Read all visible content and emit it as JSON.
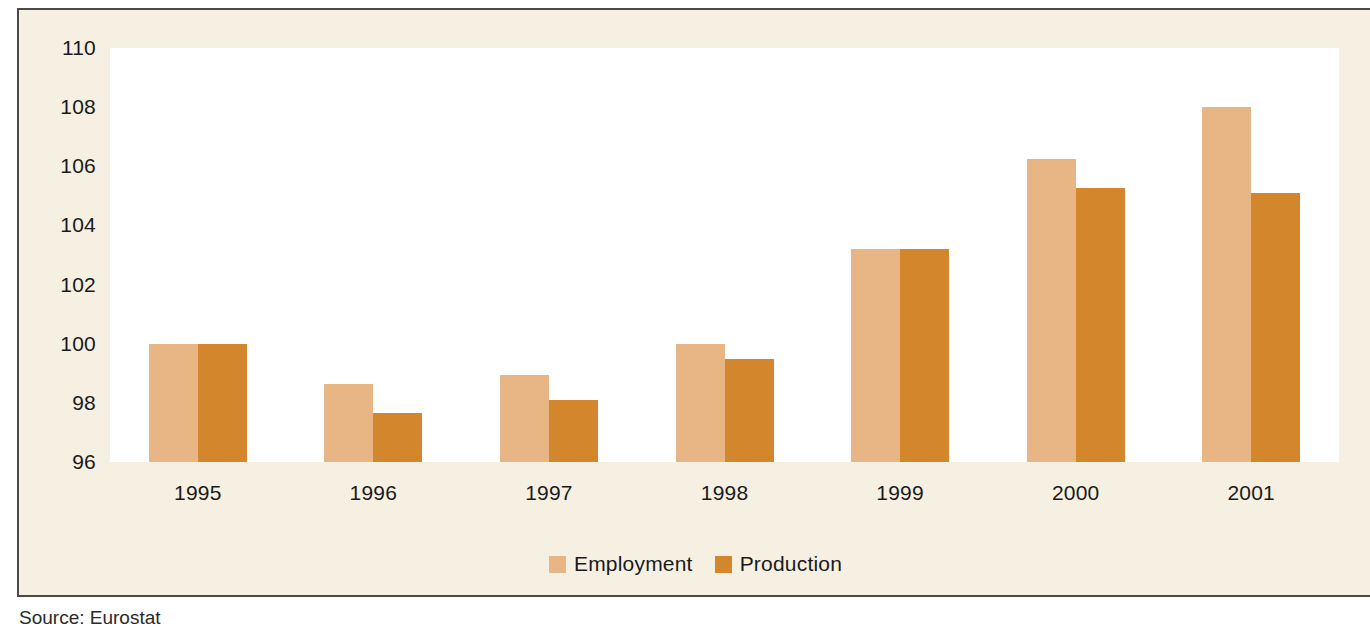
{
  "chart_data": {
    "type": "bar",
    "title": "",
    "subtitle": "",
    "xlabel": "",
    "ylabel": "",
    "categories": [
      "1995",
      "1996",
      "1997",
      "1998",
      "1999",
      "2000",
      "2001"
    ],
    "series": [
      {
        "name": "Employment",
        "color": "#E8B584",
        "values": [
          100.0,
          98.65,
          98.95,
          100.0,
          103.2,
          106.25,
          108.0
        ]
      },
      {
        "name": "Production",
        "color": "#D4862C",
        "values": [
          100.0,
          97.65,
          98.1,
          99.5,
          103.2,
          105.25,
          105.1
        ]
      }
    ],
    "ylim": [
      96,
      110
    ],
    "yticks": [
      110,
      108,
      106,
      104,
      102,
      100,
      98,
      96
    ],
    "ytick_labels": [
      "110",
      "108",
      "106",
      "104",
      "102",
      "100",
      "98",
      "96"
    ],
    "grid": false,
    "legend_position": "bottom-center"
  },
  "legend": {
    "entries": [
      {
        "label": "Employment",
        "color": "#E8B584"
      },
      {
        "label": "Production",
        "color": "#D4862C"
      }
    ]
  },
  "caption": {
    "source_note": "Source: Eurostat"
  },
  "palette": {
    "panel_background": "#F6F0E3",
    "plot_background": "#FFFFFF",
    "border": "#4A4A46",
    "text": "#1A1A1A",
    "employment": "#E8B584",
    "production": "#D4862C"
  }
}
